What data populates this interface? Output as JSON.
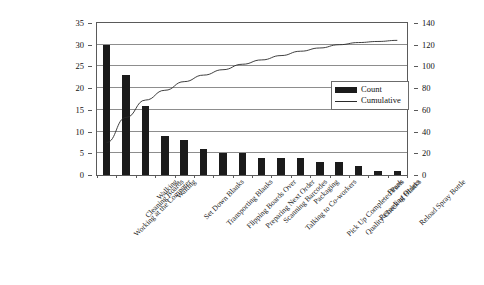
{
  "chart_data": {
    "type": "bar",
    "title": "",
    "subtitle": "",
    "xlabel": "",
    "ylabel": "",
    "y2label": "",
    "categories": [
      "Working at the Computer",
      "Cleaning Boards",
      "Walking",
      "Waiting",
      "Set Down Blanks",
      "Transporting Blanks",
      "Flipping Boards Over",
      "Preparing Next Order",
      "Scanning Barcodes",
      "Talking to Co-workers",
      "Packaging",
      "Pick Up Completed Parts",
      "Quality Check of Blanks",
      "Recording Orders",
      "Break",
      "Reload Spray Bottle"
    ],
    "series": [
      {
        "name": "Count",
        "type": "bar",
        "axis": "left",
        "color": "#1b1b1b",
        "values": [
          30,
          23,
          16,
          9,
          8,
          6,
          5,
          5,
          4,
          4,
          4,
          3,
          3,
          2,
          1,
          1
        ]
      },
      {
        "name": "Cumulative",
        "type": "line",
        "axis": "right",
        "color": "#2a2a2a",
        "values": [
          30,
          53,
          69,
          78,
          86,
          92,
          97,
          102,
          106,
          110,
          114,
          117,
          120,
          122,
          123,
          124
        ]
      }
    ],
    "ylim": [
      0,
      35
    ],
    "yticks": [
      0,
      5,
      10,
      15,
      20,
      25,
      30,
      35
    ],
    "y2lim": [
      0,
      140
    ],
    "y2ticks": [
      0,
      20,
      40,
      60,
      80,
      100,
      120,
      140
    ],
    "grid": true,
    "legend_position": "inside-right"
  },
  "legend": {
    "items": [
      {
        "label": "Count",
        "marker": "bar-swatch"
      },
      {
        "label": "Cumulative",
        "marker": "line-swatch"
      }
    ]
  }
}
